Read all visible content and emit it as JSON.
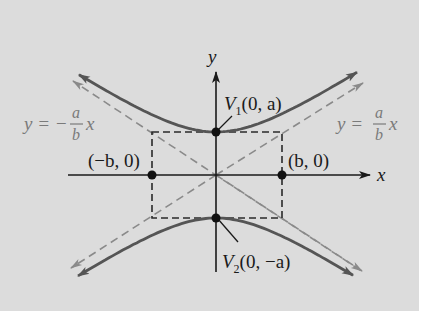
{
  "figure": {
    "type": "hyperbola-vertical-transverse-axis",
    "background": "#dcdcdc",
    "colors": {
      "axis": "#1a1a1a",
      "hyperbola": "#555555",
      "asymptote": "#8a8a8a",
      "rectangle": "#2a2a2a",
      "asymptote_label": "#7a7a7a",
      "point": "#111111"
    },
    "axes": {
      "x_label": "x",
      "y_label": "y"
    },
    "points": [
      {
        "id": "V1",
        "label_main": "V",
        "label_sub": "1",
        "label_rest": "(0, a)"
      },
      {
        "id": "V2",
        "label_main": "V",
        "label_sub": "2",
        "label_rest": "(0, −a)"
      },
      {
        "id": "neg-b",
        "label": "(−b, 0)"
      },
      {
        "id": "pos-b",
        "label": "(b, 0)"
      }
    ],
    "asymptotes": {
      "left": {
        "lhs": "y = −",
        "num": "a",
        "den": "b",
        "var": "x"
      },
      "right": {
        "lhs": "y = ",
        "num": "a",
        "den": "b",
        "var": "x"
      }
    }
  }
}
